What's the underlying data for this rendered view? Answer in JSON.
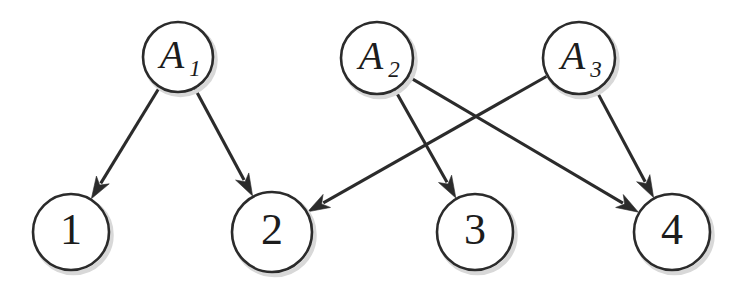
{
  "figure": {
    "type": "bipartite-assignment-diagram",
    "background_color": "#ffffff",
    "stroke_color": "#2b2b2b",
    "shadow_color": "#d8d8d8",
    "width": 743,
    "height": 289
  },
  "nodes": {
    "agents": [
      {
        "id": "A1",
        "base": "A",
        "subscript": "1",
        "cx": 178,
        "cy": 57,
        "r": 35
      },
      {
        "id": "A2",
        "base": "A",
        "subscript": "2",
        "cx": 377,
        "cy": 58,
        "r": 36
      },
      {
        "id": "A3",
        "base": "A",
        "subscript": "3",
        "cx": 579,
        "cy": 58,
        "r": 36
      }
    ],
    "tasks": [
      {
        "id": "T1",
        "label": "1",
        "cx": 71,
        "cy": 232,
        "r": 38
      },
      {
        "id": "T2",
        "label": "2",
        "cx": 272,
        "cy": 232,
        "r": 40
      },
      {
        "id": "T3",
        "label": "3",
        "cx": 475,
        "cy": 232,
        "r": 38
      },
      {
        "id": "T4",
        "label": "4",
        "cx": 672,
        "cy": 232,
        "r": 38
      }
    ]
  },
  "edges": [
    {
      "from": "A1",
      "to": "T1",
      "directed": true
    },
    {
      "from": "A1",
      "to": "T2",
      "directed": true
    },
    {
      "from": "A2",
      "to": "T3",
      "directed": true
    },
    {
      "from": "A2",
      "to": "T4",
      "directed": true
    },
    {
      "from": "A3",
      "to": "T2",
      "directed": true
    },
    {
      "from": "A3",
      "to": "T4",
      "directed": true
    }
  ]
}
